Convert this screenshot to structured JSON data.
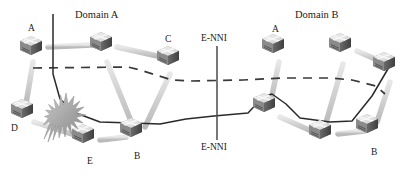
{
  "figure": {
    "type": "network-topology-diagram",
    "width": 415,
    "height": 176,
    "background": "#ffffff"
  },
  "domains": [
    {
      "id": "domain-a",
      "label": "Domain A",
      "x": 75,
      "y": 10
    },
    {
      "id": "domain-b",
      "label": "Domain B",
      "x": 295,
      "y": 10
    }
  ],
  "interface_labels": [
    {
      "id": "enni-top",
      "label": "E-NNI",
      "x": 201,
      "y": 34
    },
    {
      "id": "enni-bottom",
      "label": "E-NNI",
      "x": 201,
      "y": 143
    }
  ],
  "boundary_line": {
    "id": "enni-boundary",
    "x": 217,
    "y_top": 46,
    "y_bottom": 140,
    "color": "#4a4a4a"
  },
  "nodes": [
    {
      "id": "a-left",
      "label": "A",
      "x": 31,
      "y": 47,
      "label_x": 28,
      "label_y": 24,
      "domain": "Domain A"
    },
    {
      "id": "hub-a",
      "label": "",
      "x": 101,
      "y": 43,
      "label_x": 0,
      "label_y": 0,
      "domain": "Domain A"
    },
    {
      "id": "c-left",
      "label": "C",
      "x": 168,
      "y": 57,
      "label_x": 165,
      "label_y": 35,
      "domain": "Domain A"
    },
    {
      "id": "d-left",
      "label": "D",
      "x": 22,
      "y": 110,
      "label_x": 11,
      "label_y": 124,
      "domain": "Domain A"
    },
    {
      "id": "e-left",
      "label": "E",
      "x": 83,
      "y": 135,
      "label_x": 87,
      "label_y": 157,
      "domain": "Domain A"
    },
    {
      "id": "b-left",
      "label": "B",
      "x": 131,
      "y": 129,
      "label_x": 134,
      "label_y": 152,
      "domain": "Domain A"
    },
    {
      "id": "a-right",
      "label": "A",
      "x": 273,
      "y": 45,
      "label_x": 272,
      "label_y": 25,
      "domain": "Domain B"
    },
    {
      "id": "hub-b",
      "label": "",
      "x": 340,
      "y": 44,
      "label_x": 0,
      "label_y": 0,
      "domain": "Domain B"
    },
    {
      "id": "far-right",
      "label": "",
      "x": 384,
      "y": 63,
      "label_x": 0,
      "label_y": 0,
      "domain": "Domain B"
    },
    {
      "id": "mid-right",
      "label": "",
      "x": 264,
      "y": 104,
      "label_x": 0,
      "label_y": 0,
      "domain": "Domain B"
    },
    {
      "id": "low-mid",
      "label": "",
      "x": 320,
      "y": 131,
      "label_x": 0,
      "label_y": 0,
      "domain": "Domain B"
    },
    {
      "id": "b-right",
      "label": "B",
      "x": 367,
      "y": 125,
      "label_x": 371,
      "label_y": 148,
      "domain": "Domain B"
    }
  ],
  "failure_marker": {
    "id": "link-failure-burst",
    "x": 43,
    "y": 92,
    "color": "#9a9a9a"
  },
  "physical_links": [
    {
      "from": "a-left",
      "to": "hub-a"
    },
    {
      "from": "hub-a",
      "to": "c-left"
    },
    {
      "from": "a-left",
      "to": "d-left"
    },
    {
      "from": "d-left",
      "to": "e-left"
    },
    {
      "from": "e-left",
      "to": "b-left"
    },
    {
      "from": "b-left",
      "to": "hub-a"
    },
    {
      "from": "c-left",
      "to": "b-left"
    },
    {
      "from": "a-right",
      "to": "hub-b"
    },
    {
      "from": "hub-b",
      "to": "far-right"
    },
    {
      "from": "a-right",
      "to": "mid-right"
    },
    {
      "from": "mid-right",
      "to": "low-mid"
    },
    {
      "from": "low-mid",
      "to": "b-right"
    },
    {
      "from": "b-right",
      "to": "far-right"
    },
    {
      "from": "hub-b",
      "to": "low-mid"
    }
  ],
  "paths": {
    "dashed_path": {
      "id": "dashed-control-path",
      "style": "dashed",
      "color": "#3a3a3a",
      "description": "dashed horizontal path spanning Domain A to Domain B"
    },
    "solid_path": {
      "id": "solid-data-path",
      "style": "solid",
      "color": "#2a2a2a",
      "description": "solid restored path from failure point across E-NNI to Domain B"
    }
  },
  "colors": {
    "link_gray": "#cfcfcf",
    "router_top": "#e2e2e2",
    "router_front": "#7d7d7d",
    "router_side": "#5a5a5a",
    "text": "#1a1a1a"
  }
}
